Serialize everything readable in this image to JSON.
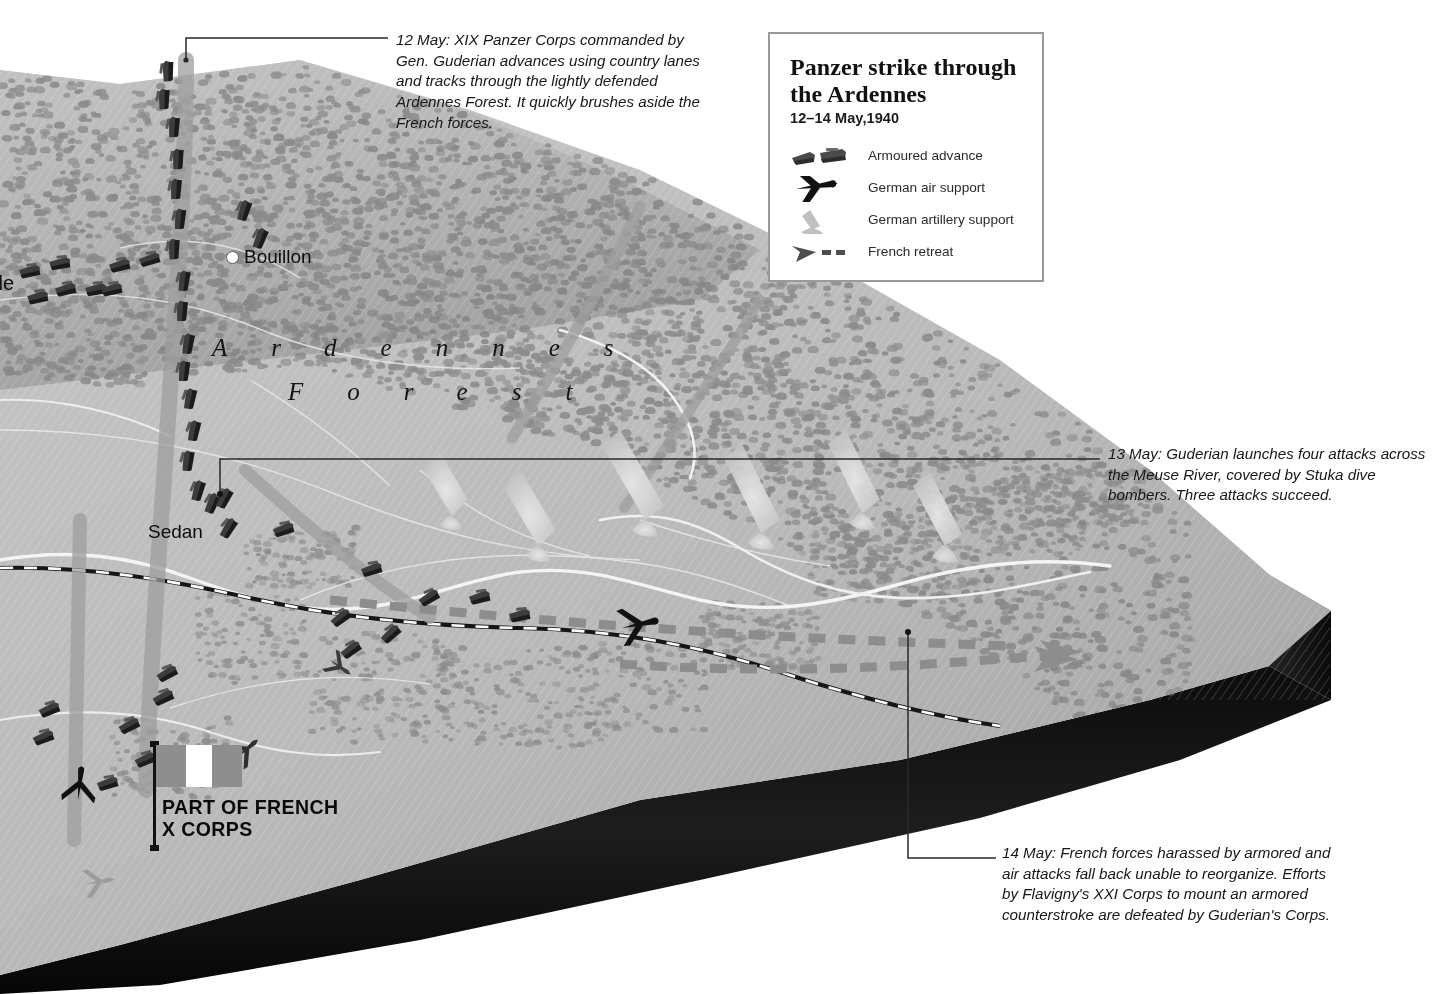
{
  "legend": {
    "title": "Panzer strike through\nthe Ardennes",
    "subtitle": "12–14 May,1940",
    "items": [
      {
        "icon": "tank-icon",
        "label": "Armoured advance"
      },
      {
        "icon": "airplane-icon",
        "label": "German air support"
      },
      {
        "icon": "artillery-icon",
        "label": "German artillery support"
      },
      {
        "icon": "retreat-arrow-icon",
        "label": "French retreat"
      }
    ]
  },
  "annotations": {
    "may12": "12 May: XIX Panzer Corps commanded by Gen. Guderian advances using country lanes and tracks through the lightly defended Ardennes Forest. It quickly brushes aside the French forces.",
    "may13": "13 May: Guderian launches four attacks across the Meuse River, covered by Stuka dive bombers. Three attacks succeed.",
    "may14": "14 May: French forces harassed by armored and air attacks fall back unable to reorganize. Efforts by Flavigny's XXI Corps to mount an armored counterstroke are defeated by Guderian's Corps."
  },
  "map_labels": {
    "bouillon": "Bouillon",
    "sedan": "Sedan",
    "clipped_city": "lle",
    "forest_line1": "Ardennes",
    "forest_line2": "Forest"
  },
  "unit_marker": {
    "label": "PART OF FRENCH\nX CORPS",
    "flag": "french-tricolour"
  },
  "colors": {
    "terrain_high": "#c9c9c9",
    "terrain_low": "#a8a8a8",
    "forest": "#8a8a8a",
    "base_slab": "#111111",
    "river": "#f2f2f2",
    "retreat": "#8c8c8c",
    "legend_border": "#9a9a9a",
    "text": "#171717"
  }
}
